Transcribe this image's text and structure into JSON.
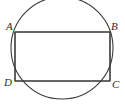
{
  "figure": {
    "type": "geometry-diagram",
    "canvas": {
      "width": 125,
      "height": 105,
      "background": "#ffffff"
    },
    "stroke_color": "#3a3a3a",
    "stroke_width": 1,
    "circle": {
      "name": "circumscribed-circle",
      "center_x": 62,
      "center_y": 48,
      "radius": 51,
      "filled": false,
      "clipped_at_bottom": true
    },
    "rectangle": {
      "name": "inscribed-rectangle",
      "left": 15,
      "top": 32,
      "right": 110,
      "bottom": 81,
      "width": 95,
      "height": 49,
      "filled": false
    },
    "vertices": [
      {
        "id": "A",
        "label": "A",
        "x": 15,
        "y": 32,
        "position": "top-left",
        "label_x": 6,
        "label_y": 21
      },
      {
        "id": "B",
        "label": "B",
        "x": 110,
        "y": 32,
        "position": "top-right",
        "label_x": 111,
        "label_y": 21
      },
      {
        "id": "C",
        "label": "C",
        "x": 110,
        "y": 81,
        "position": "bottom-right",
        "label_x": 112,
        "label_y": 79
      },
      {
        "id": "D",
        "label": "D",
        "x": 15,
        "y": 81,
        "position": "bottom-left",
        "label_x": 4,
        "label_y": 77
      }
    ]
  }
}
